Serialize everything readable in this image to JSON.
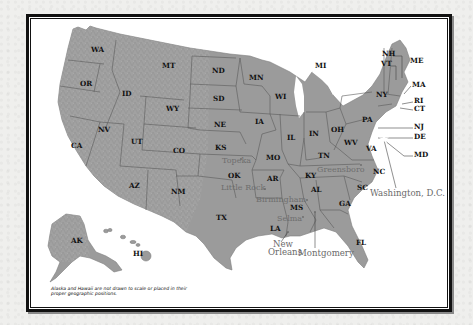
{
  "map": {
    "title": "United States",
    "colors": {
      "page_background": "#efefed",
      "frame_border": "#111111",
      "land_fill": "#9b9b9b",
      "state_label": "#111111",
      "city_label": "#6e6e6e"
    },
    "states": [
      {
        "abbr": "WA",
        "x": 91,
        "y": 52
      },
      {
        "abbr": "OR",
        "x": 80,
        "y": 86
      },
      {
        "abbr": "MT",
        "x": 162,
        "y": 68
      },
      {
        "abbr": "ID",
        "x": 122,
        "y": 96
      },
      {
        "abbr": "WY",
        "x": 166,
        "y": 111
      },
      {
        "abbr": "ND",
        "x": 212,
        "y": 73
      },
      {
        "abbr": "SD",
        "x": 213,
        "y": 101
      },
      {
        "abbr": "NE",
        "x": 214,
        "y": 127
      },
      {
        "abbr": "MN",
        "x": 249,
        "y": 80
      },
      {
        "abbr": "WI",
        "x": 275,
        "y": 99
      },
      {
        "abbr": "MI",
        "x": 315,
        "y": 68
      },
      {
        "abbr": "IA",
        "x": 255,
        "y": 124
      },
      {
        "abbr": "IL",
        "x": 287,
        "y": 140
      },
      {
        "abbr": "IN",
        "x": 309,
        "y": 136
      },
      {
        "abbr": "OH",
        "x": 331,
        "y": 132
      },
      {
        "abbr": "PA",
        "x": 362,
        "y": 122
      },
      {
        "abbr": "NY",
        "x": 376,
        "y": 97
      },
      {
        "abbr": "NV",
        "x": 98,
        "y": 132
      },
      {
        "abbr": "UT",
        "x": 131,
        "y": 144
      },
      {
        "abbr": "CO",
        "x": 173,
        "y": 153
      },
      {
        "abbr": "KS",
        "x": 215,
        "y": 150
      },
      {
        "abbr": "MO",
        "x": 266,
        "y": 160
      },
      {
        "abbr": "CA",
        "x": 71,
        "y": 148
      },
      {
        "abbr": "AZ",
        "x": 129,
        "y": 188
      },
      {
        "abbr": "NM",
        "x": 171,
        "y": 194
      },
      {
        "abbr": "OK",
        "x": 228,
        "y": 178
      },
      {
        "abbr": "AR",
        "x": 267,
        "y": 181
      },
      {
        "abbr": "TN",
        "x": 318,
        "y": 158
      },
      {
        "abbr": "KY",
        "x": 305,
        "y": 178
      },
      {
        "abbr": "WV",
        "x": 344,
        "y": 145
      },
      {
        "abbr": "VA",
        "x": 366,
        "y": 151
      },
      {
        "abbr": "NC",
        "x": 373,
        "y": 174
      },
      {
        "abbr": "SC",
        "x": 357,
        "y": 190
      },
      {
        "abbr": "GA",
        "x": 339,
        "y": 206
      },
      {
        "abbr": "AL",
        "x": 311,
        "y": 192
      },
      {
        "abbr": "MS",
        "x": 290,
        "y": 210
      },
      {
        "abbr": "LA",
        "x": 270,
        "y": 231
      },
      {
        "abbr": "TX",
        "x": 216,
        "y": 220
      },
      {
        "abbr": "FL",
        "x": 356,
        "y": 245
      },
      {
        "abbr": "AK",
        "x": 71,
        "y": 243
      },
      {
        "abbr": "HI",
        "x": 133,
        "y": 256
      }
    ],
    "callout_states": [
      {
        "abbr": "NH",
        "x": 382,
        "y": 56
      },
      {
        "abbr": "VT",
        "x": 381,
        "y": 66
      },
      {
        "abbr": "ME",
        "x": 410,
        "y": 63
      },
      {
        "abbr": "MA",
        "x": 412,
        "y": 87
      },
      {
        "abbr": "RI",
        "x": 414,
        "y": 103
      },
      {
        "abbr": "CT",
        "x": 414,
        "y": 111
      },
      {
        "abbr": "NJ",
        "x": 414,
        "y": 129
      },
      {
        "abbr": "DE",
        "x": 414,
        "y": 139
      },
      {
        "abbr": "MD",
        "x": 414,
        "y": 157
      }
    ],
    "cities": [
      {
        "name": "Topeka",
        "x": 222,
        "y": 163
      },
      {
        "name": "Little Rock",
        "x": 221,
        "y": 190
      },
      {
        "name": "Birmingham",
        "x": 256,
        "y": 202
      },
      {
        "name": "Greensboro",
        "x": 317,
        "y": 172
      },
      {
        "name": "Selma",
        "x": 277,
        "y": 221
      }
    ],
    "callout_cities": [
      {
        "name_line1": "New",
        "name_line2": "Orleans",
        "x": 269,
        "y": 247
      },
      {
        "name": "Montgomery",
        "x": 298,
        "y": 256
      },
      {
        "name": "Washington, D.C.",
        "x": 370,
        "y": 196
      }
    ],
    "caption": "Alaska and Hawaii are not drawn to scale or placed in their proper geographic positions."
  }
}
